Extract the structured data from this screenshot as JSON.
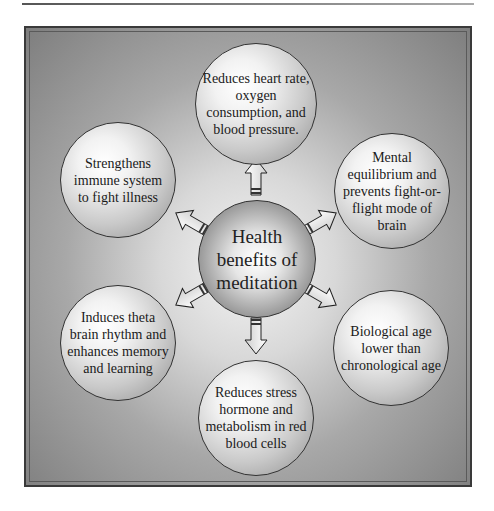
{
  "diagram": {
    "center": {
      "label": "Health benefits of meditation"
    },
    "nodes": [
      {
        "id": "top",
        "label": "Reduces heart rate, oxygen consumption, and blood pressure."
      },
      {
        "id": "upper-right",
        "label": "Mental equilibrium and prevents fight-or-flight mode of brain"
      },
      {
        "id": "lower-right",
        "label": "Biological age lower than chronological age"
      },
      {
        "id": "bottom",
        "label": "Reduces stress hormone and metabolism in red blood cells"
      },
      {
        "id": "lower-left",
        "label": "Induces theta brain rhythm and enhances memory and learning"
      },
      {
        "id": "upper-left",
        "label": "Strengthens immune system to fight illness"
      }
    ],
    "colors": {
      "frame_border": "#3a3a3a",
      "background_dark": "#7e7e7e",
      "background_light": "#f4f4f4"
    }
  }
}
